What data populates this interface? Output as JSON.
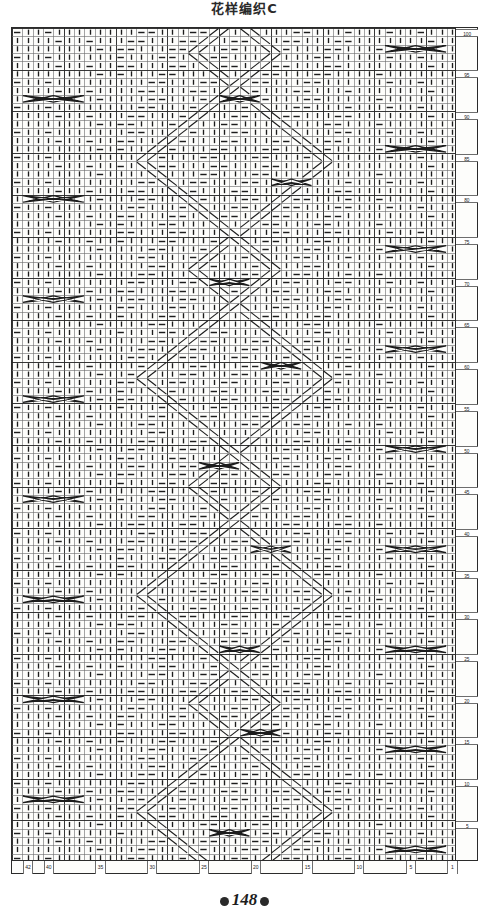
{
  "document": {
    "title": "花样编织C",
    "page_number": "148"
  },
  "chart_data": {
    "type": "heatmap",
    "chart_kind": "knitting-stitch-chart",
    "title": "花样编织C",
    "xlabel": "",
    "ylabel": "",
    "grid": true,
    "columns": 43,
    "rows": 100,
    "x_tick_labels": [
      "1",
      "5",
      "10",
      "15",
      "20",
      "25",
      "30",
      "35",
      "40",
      "42"
    ],
    "x_tick_positions": [
      1,
      5,
      10,
      15,
      20,
      25,
      30,
      35,
      40,
      42
    ],
    "y_tick_labels": [
      "5",
      "10",
      "15",
      "20",
      "25",
      "30",
      "35",
      "40",
      "45",
      "50",
      "55",
      "60",
      "65",
      "70",
      "75",
      "80",
      "85",
      "90",
      "95",
      "100"
    ],
    "y_tick_positions": [
      5,
      10,
      15,
      20,
      25,
      30,
      35,
      40,
      45,
      50,
      55,
      60,
      65,
      70,
      75,
      80,
      85,
      90,
      95,
      100
    ],
    "x_axis_direction": "right-to-left",
    "y_axis_direction": "bottom-to-top",
    "legend": [],
    "symbols": [
      {
        "key": "knit",
        "glyph": "|",
        "name": "knit-stitch",
        "description": "vertical bar"
      },
      {
        "key": "purl",
        "glyph": "—",
        "name": "purl-stitch",
        "description": "horizontal dash"
      },
      {
        "key": "cable_x",
        "glyph": "X",
        "name": "cable-cross-4",
        "description": "wide X crossing over 4 stitches"
      },
      {
        "key": "twist_right",
        "glyph": "/",
        "name": "right-travelling-stitch",
        "description": "diagonal rising to the right"
      },
      {
        "key": "twist_left",
        "glyph": "\\",
        "name": "left-travelling-stitch",
        "description": "diagonal rising to the left"
      },
      {
        "key": "blank",
        "glyph": " ",
        "name": "empty-cell",
        "description": "no stitch symbol"
      }
    ],
    "cell_width_px": 10.35,
    "cell_height_px": 8.34,
    "colors": {
      "grid_line": "#6d6d6d",
      "major_grid_line": "#2b2b2b",
      "symbol": "#1c1c1c",
      "background": "#fdfdfb"
    }
  }
}
